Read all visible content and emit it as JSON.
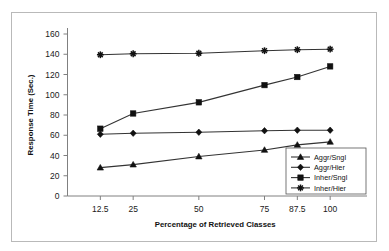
{
  "figure": {
    "background_color": "#ffffff",
    "frame_color": "#b9b9b9",
    "plot_line_color": "#333333",
    "axis_color": "#808080"
  },
  "chart_data": {
    "type": "line",
    "title": "",
    "subtitle": "",
    "xlabel": "Percentage of Retrieved Classes",
    "ylabel": "Response Time (Sec.)",
    "categories": [
      "12.5",
      "25",
      "50",
      "75",
      "87.5",
      "100"
    ],
    "x": [
      12.5,
      25,
      50,
      75,
      87.5,
      100
    ],
    "xlim": [
      0,
      112.5
    ],
    "ylim": [
      0,
      160
    ],
    "yticks": [
      0,
      20,
      40,
      60,
      80,
      100,
      120,
      140,
      160
    ],
    "xticks": [
      12.5,
      25,
      50,
      75,
      87.5,
      100
    ],
    "grid": false,
    "legend_position": "lower-right",
    "series": [
      {
        "name": "Aggr/Sngl",
        "marker": "triangle",
        "values": [
          28,
          31,
          39,
          45.5,
          50.5,
          53.5
        ]
      },
      {
        "name": "Aggr/Hier",
        "marker": "diamond",
        "values": [
          61,
          62,
          63,
          64.5,
          65,
          65
        ]
      },
      {
        "name": "Inher/Sngl",
        "marker": "square",
        "values": [
          66.5,
          81.5,
          92.5,
          109.5,
          117.5,
          128
        ]
      },
      {
        "name": "Inher/Hier",
        "marker": "asterisk",
        "values": [
          139.5,
          140.5,
          141,
          143.5,
          144.5,
          145
        ]
      }
    ]
  },
  "axes": {
    "y_tick_labels": [
      "160",
      "140",
      "120",
      "100",
      "80",
      "60",
      "40",
      "20",
      "0"
    ],
    "x_tick_labels": [
      "12.5",
      "25",
      "50",
      "75",
      "87.5",
      "100"
    ],
    "y_axis_title": "Response Time (Sec.)",
    "x_axis_title": "Percentage of Retrieved Classes"
  },
  "legend": {
    "items": [
      {
        "label": "Aggr/Sngl",
        "marker": "triangle"
      },
      {
        "label": "Aggr/Hier",
        "marker": "diamond"
      },
      {
        "label": "Inher/Sngl",
        "marker": "square"
      },
      {
        "label": "Inher/Hier",
        "marker": "asterisk"
      }
    ]
  }
}
